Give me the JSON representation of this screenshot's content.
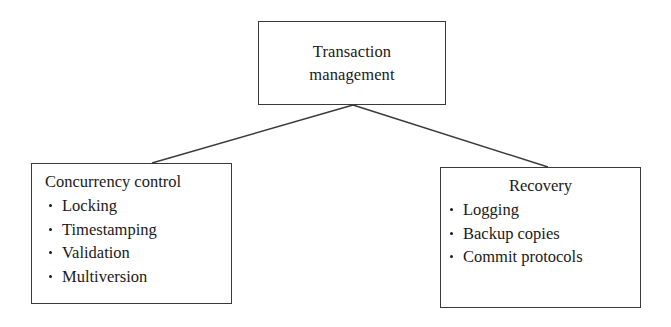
{
  "diagram": {
    "type": "hierarchy-tree",
    "background_color": "#ffffff",
    "line_color": "#3a3a3a",
    "text_color": "#1a1a1a",
    "root": {
      "title_lines": [
        "Transaction",
        "management"
      ]
    },
    "children": [
      {
        "id": "concurrency-control",
        "heading": "Concurrency control",
        "heading_align": "left",
        "items": [
          "Locking",
          "Timestamping",
          "Validation",
          "Multiversion"
        ]
      },
      {
        "id": "recovery",
        "heading": "Recovery",
        "heading_align": "center",
        "items": [
          "Logging",
          "Backup copies",
          "Commit protocols"
        ]
      }
    ],
    "connectors": [
      {
        "from": "root-bottom-center",
        "to": "concurrency-control-top"
      },
      {
        "from": "root-bottom-center",
        "to": "recovery-top"
      }
    ]
  }
}
